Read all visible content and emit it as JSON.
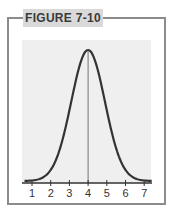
{
  "figure": {
    "label": "FIGURE 7-10"
  },
  "chart_data": {
    "type": "line",
    "title": "FIGURE 7-10",
    "xlabel": "",
    "ylabel": "",
    "x_ticks": [
      "1",
      "2",
      "3",
      "4",
      "5",
      "6",
      "7"
    ],
    "xlim": [
      0.5,
      7.5
    ],
    "series": [
      {
        "name": "normal curve",
        "mean": 4,
        "sd": 0.9,
        "x": [
          1,
          1.5,
          2,
          2.5,
          3,
          3.5,
          4,
          4.5,
          5,
          5.5,
          6,
          6.5,
          7
        ],
        "values": [
          0.004,
          0.021,
          0.084,
          0.25,
          0.54,
          0.86,
          1.0,
          0.86,
          0.54,
          0.25,
          0.084,
          0.021,
          0.004
        ]
      }
    ],
    "annotations": [
      {
        "type": "vline",
        "x": 4
      }
    ],
    "grid": false,
    "legend": "none"
  }
}
